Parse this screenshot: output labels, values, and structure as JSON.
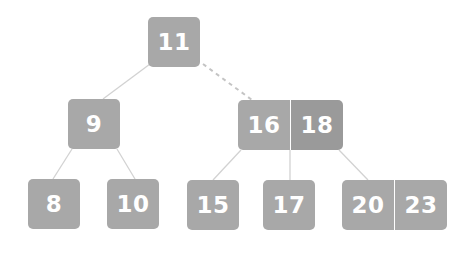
{
  "diagram": {
    "type": "2-3 tree",
    "colors": {
      "node_fill": "#a8a8a8",
      "node_fill_highlight": "#9a9a9a",
      "key_text": "#ffffff",
      "edge": "#d2d2d2",
      "dashed_edge": "#c4c4c4"
    },
    "root": {
      "keys": [
        "11"
      ]
    },
    "level1": [
      {
        "keys": [
          "9"
        ]
      },
      {
        "keys": [
          "16",
          "18"
        ]
      }
    ],
    "level2": [
      {
        "keys": [
          "8"
        ]
      },
      {
        "keys": [
          "10"
        ]
      },
      {
        "keys": [
          "15"
        ]
      },
      {
        "keys": [
          "17"
        ]
      },
      {
        "keys": [
          "20",
          "23"
        ]
      }
    ],
    "edges": [
      {
        "from": "11",
        "to": "9",
        "style": "solid"
      },
      {
        "from": "11",
        "to": "16|18",
        "style": "dashed"
      },
      {
        "from": "9",
        "to": "8",
        "style": "solid"
      },
      {
        "from": "9",
        "to": "10",
        "style": "solid"
      },
      {
        "from": "16|18",
        "to": "15",
        "style": "solid"
      },
      {
        "from": "16|18",
        "to": "17",
        "style": "solid"
      },
      {
        "from": "16|18",
        "to": "20|23",
        "style": "solid"
      }
    ]
  }
}
